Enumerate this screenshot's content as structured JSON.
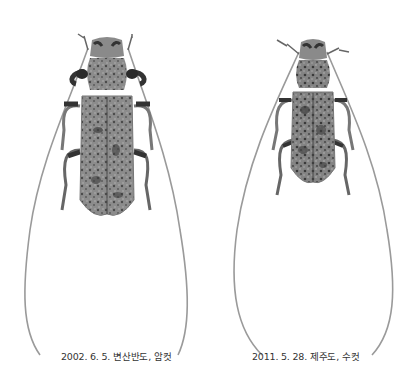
{
  "plate": {
    "specimens": [
      {
        "id": "left",
        "caption": "2002. 6. 5. 변산반도, 암컷",
        "sex": "female"
      },
      {
        "id": "right",
        "caption": "2011. 5. 28. 제주도, 수컷",
        "sex": "male"
      }
    ]
  },
  "colors": {
    "background": "#ffffff",
    "body": "#8a8a8a",
    "dark_mottle": "#3e3e3e",
    "antenna": "#9a9a9a",
    "caption_text": "#333333"
  }
}
